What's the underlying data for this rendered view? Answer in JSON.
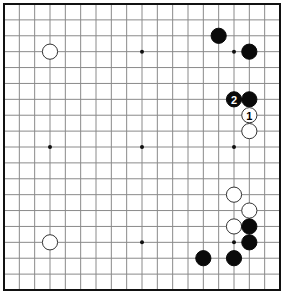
{
  "board": {
    "size": 19,
    "left": 4,
    "top": 4,
    "right": 280,
    "bottom": 290,
    "stone_radius": 7.6,
    "colors": {
      "background": "#ffffff",
      "grid": "#8a8a8a",
      "border": "#111111",
      "black": "#0a0a0a",
      "white": "#ffffff",
      "white_outline": "#333333"
    }
  },
  "hoshi": [
    {
      "col": 3,
      "row": 3
    },
    {
      "col": 9,
      "row": 3
    },
    {
      "col": 15,
      "row": 3
    },
    {
      "col": 3,
      "row": 9
    },
    {
      "col": 9,
      "row": 9
    },
    {
      "col": 15,
      "row": 9
    },
    {
      "col": 3,
      "row": 15
    },
    {
      "col": 9,
      "row": 15
    },
    {
      "col": 15,
      "row": 15
    }
  ],
  "stones": [
    {
      "color": "white",
      "col": 3,
      "row": 3,
      "label": ""
    },
    {
      "color": "black",
      "col": 14,
      "row": 2,
      "label": ""
    },
    {
      "color": "black",
      "col": 16,
      "row": 3,
      "label": ""
    },
    {
      "color": "black",
      "col": 15,
      "row": 6,
      "label": "2"
    },
    {
      "color": "black",
      "col": 16,
      "row": 6,
      "label": ""
    },
    {
      "color": "white",
      "col": 16,
      "row": 7,
      "label": "1"
    },
    {
      "color": "white",
      "col": 16,
      "row": 8,
      "label": ""
    },
    {
      "color": "white",
      "col": 15,
      "row": 12,
      "label": ""
    },
    {
      "color": "white",
      "col": 16,
      "row": 13,
      "label": ""
    },
    {
      "color": "white",
      "col": 15,
      "row": 14,
      "label": ""
    },
    {
      "color": "black",
      "col": 16,
      "row": 14,
      "label": ""
    },
    {
      "color": "black",
      "col": 16,
      "row": 15,
      "label": ""
    },
    {
      "color": "black",
      "col": 15,
      "row": 16,
      "label": ""
    },
    {
      "color": "black",
      "col": 13,
      "row": 16,
      "label": ""
    },
    {
      "color": "white",
      "col": 3,
      "row": 15,
      "label": ""
    }
  ]
}
